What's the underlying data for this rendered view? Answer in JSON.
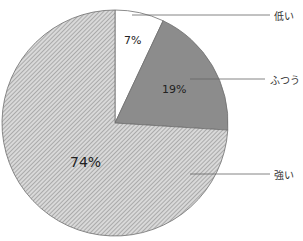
{
  "chart_data": {
    "type": "pie",
    "title": "",
    "categories": [
      "低い",
      "ふつう",
      "強い"
    ],
    "values": [
      7,
      19,
      74
    ],
    "labels": [
      "7%",
      "19%",
      "74%"
    ],
    "fills": [
      "#ffffff",
      "#8c8c8c",
      "hatch"
    ],
    "start_angle_deg": 90,
    "direction": "clockwise",
    "legend_position": "right, leader lines"
  },
  "labels": {
    "low": "低い",
    "normal": "ふつう",
    "strong": "強い",
    "pct_low": "7%",
    "pct_normal": "19%",
    "pct_strong": "74%"
  }
}
